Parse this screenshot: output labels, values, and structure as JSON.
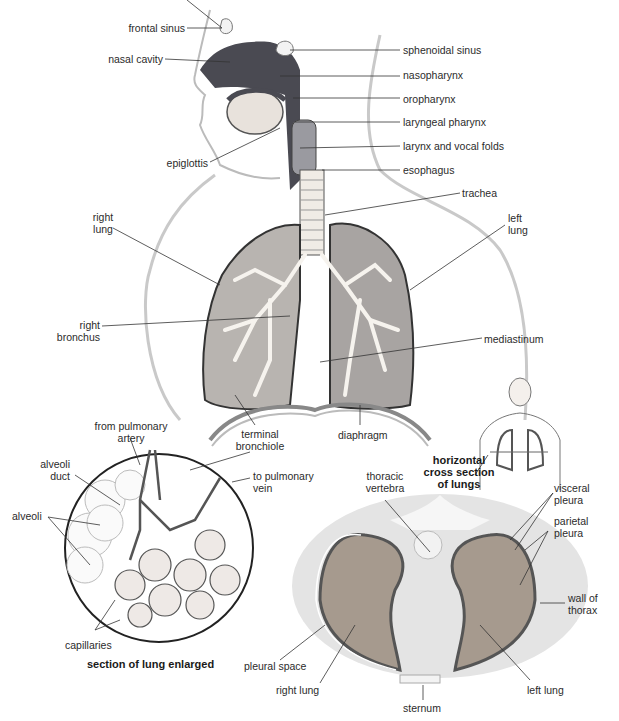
{
  "upper_diagram": {
    "labels": {
      "frontal_sinus": "frontal sinus",
      "nasal_cavity": "nasal cavity",
      "sphenoidal_sinus": "sphenoidal sinus",
      "nasopharynx": "nasopharynx",
      "oropharynx": "oropharynx",
      "laryngeal_pharynx": "laryngeal pharynx",
      "larynx_vocal_folds": "larynx and vocal folds",
      "epiglottis": "epiglottis",
      "esophagus": "esophagus",
      "trachea": "trachea",
      "right_lung_1": "right",
      "right_lung_2": "lung",
      "left_lung_1": "left",
      "left_lung_2": "lung",
      "right_bronchus_1": "right",
      "right_bronchus_2": "bronchus",
      "mediastinum": "mediastinum",
      "terminal_bronchiole_1": "terminal",
      "terminal_bronchiole_2": "bronchiole",
      "diaphragm": "diaphragm"
    }
  },
  "enlarged_section": {
    "title": "section of lung enlarged",
    "labels": {
      "from_pulmonary_artery_1": "from pulmonary",
      "from_pulmonary_artery_2": "artery",
      "alveoli_duct_1": "alveoli",
      "alveoli_duct_2": "duct",
      "to_pulmonary_vein_1": "to pulmonary",
      "to_pulmonary_vein_2": "vein",
      "alveoli": "alveoli",
      "capillaries": "capillaries"
    }
  },
  "cross_section": {
    "title_1": "horizontal",
    "title_2": "cross section",
    "title_3": "of lungs",
    "labels": {
      "thoracic_vertebra_1": "thoracic",
      "thoracic_vertebra_2": "vertebra",
      "visceral_pleura_1": "visceral",
      "visceral_pleura_2": "pleura",
      "parietal_pleura_1": "parietal",
      "parietal_pleura_2": "pleura",
      "wall_of_thorax_1": "wall of",
      "wall_of_thorax_2": "thorax",
      "pleural_space": "pleural space",
      "right_lung": "right lung",
      "left_lung": "left lung",
      "sternum": "sternum"
    }
  }
}
